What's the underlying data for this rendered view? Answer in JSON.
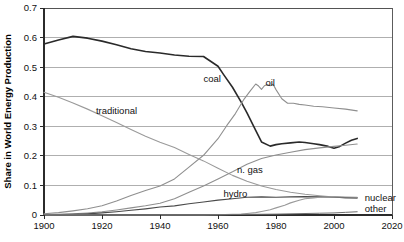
{
  "chart_data": {
    "type": "line",
    "title": "",
    "xlabel": "",
    "ylabel": "Share in World Energy Production",
    "xlim": [
      1900,
      2020
    ],
    "ylim": [
      0,
      0.7
    ],
    "grid": true,
    "legend": "inline-labels",
    "x_ticks": [
      "1900",
      "1920",
      "1940",
      "1960",
      "1980",
      "2000",
      "2020"
    ],
    "x_tick_values": [
      1900,
      1920,
      1940,
      1960,
      1980,
      2000,
      2020
    ],
    "y_ticks": [
      "0",
      "0.1",
      "0.2",
      "0.3",
      "0.4",
      "0.5",
      "0.6",
      "0.7"
    ],
    "y_tick_values": [
      0,
      0.1,
      0.2,
      0.3,
      0.4,
      0.5,
      0.6,
      0.7
    ],
    "series": [
      {
        "name": "coal",
        "label": "coal",
        "color": "#2a2a2a",
        "width": 1.6,
        "label_x": 1958,
        "label_y": 0.462,
        "x": [
          1900,
          1905,
          1910,
          1915,
          1920,
          1925,
          1930,
          1935,
          1940,
          1945,
          1950,
          1955,
          1960,
          1962,
          1965,
          1968,
          1970,
          1973,
          1975,
          1978,
          1980,
          1982,
          1985,
          1988,
          1990,
          1993,
          1995,
          1998,
          2000,
          2002,
          2004,
          2006,
          2008
        ],
        "y": [
          0.578,
          0.592,
          0.604,
          0.598,
          0.588,
          0.576,
          0.562,
          0.553,
          0.548,
          0.541,
          0.537,
          0.536,
          0.503,
          0.474,
          0.432,
          0.382,
          0.345,
          0.286,
          0.247,
          0.233,
          0.238,
          0.241,
          0.244,
          0.247,
          0.245,
          0.241,
          0.238,
          0.232,
          0.226,
          0.232,
          0.243,
          0.253,
          0.259
        ]
      },
      {
        "name": "oil",
        "label": "oil",
        "color": "#8f8f8f",
        "width": 1.1,
        "label_x": 1978,
        "label_y": 0.448,
        "x": [
          1900,
          1905,
          1910,
          1915,
          1920,
          1925,
          1930,
          1935,
          1940,
          1945,
          1950,
          1955,
          1960,
          1963,
          1966,
          1969,
          1971,
          1973,
          1974,
          1975,
          1976,
          1977,
          1978,
          1979,
          1980,
          1982,
          1984,
          1986,
          1988,
          1990,
          1993,
          1996,
          2000,
          2004,
          2008
        ],
        "y": [
          0.004,
          0.008,
          0.014,
          0.021,
          0.031,
          0.047,
          0.066,
          0.083,
          0.098,
          0.122,
          0.162,
          0.202,
          0.258,
          0.302,
          0.343,
          0.392,
          0.418,
          0.443,
          0.436,
          0.425,
          0.437,
          0.441,
          0.437,
          0.442,
          0.424,
          0.393,
          0.378,
          0.378,
          0.374,
          0.372,
          0.368,
          0.366,
          0.362,
          0.358,
          0.352
        ]
      },
      {
        "name": "traditional",
        "label": "traditional",
        "color": "#9a9a9a",
        "width": 1.1,
        "label_x": 1925,
        "label_y": 0.352,
        "x": [
          1900,
          1905,
          1910,
          1915,
          1920,
          1925,
          1930,
          1935,
          1940,
          1945,
          1950,
          1955,
          1960,
          1965,
          1970,
          1975,
          1980,
          1985,
          1990,
          1995,
          2000,
          2004,
          2008
        ],
        "y": [
          0.415,
          0.398,
          0.379,
          0.358,
          0.336,
          0.313,
          0.289,
          0.266,
          0.246,
          0.228,
          0.205,
          0.183,
          0.158,
          0.134,
          0.114,
          0.098,
          0.086,
          0.077,
          0.07,
          0.065,
          0.061,
          0.058,
          0.056
        ]
      },
      {
        "name": "n. gas",
        "label": "n. gas",
        "color": "#8f8f8f",
        "width": 1.1,
        "label_x": 1971,
        "label_y": 0.152,
        "x": [
          1900,
          1905,
          1910,
          1915,
          1920,
          1925,
          1930,
          1935,
          1940,
          1945,
          1950,
          1955,
          1960,
          1965,
          1970,
          1975,
          1980,
          1985,
          1990,
          1995,
          2000,
          2004,
          2008
        ],
        "y": [
          0.001,
          0.002,
          0.004,
          0.007,
          0.011,
          0.017,
          0.024,
          0.031,
          0.04,
          0.055,
          0.077,
          0.098,
          0.122,
          0.146,
          0.172,
          0.191,
          0.203,
          0.212,
          0.221,
          0.227,
          0.232,
          0.236,
          0.24
        ]
      },
      {
        "name": "hydro",
        "label": "hydro",
        "color": "#4a4a4a",
        "width": 1.2,
        "label_x": 1966,
        "label_y": 0.073,
        "x": [
          1900,
          1905,
          1910,
          1915,
          1920,
          1925,
          1930,
          1935,
          1940,
          1945,
          1950,
          1955,
          1960,
          1965,
          1970,
          1975,
          1980,
          1985,
          1990,
          1995,
          2000,
          2004,
          2008
        ],
        "y": [
          0.0,
          0.001,
          0.002,
          0.004,
          0.007,
          0.011,
          0.016,
          0.021,
          0.027,
          0.031,
          0.038,
          0.044,
          0.05,
          0.055,
          0.06,
          0.061,
          0.06,
          0.061,
          0.062,
          0.061,
          0.06,
          0.059,
          0.059
        ]
      },
      {
        "name": "nuclear",
        "label": "nuclear",
        "color": "#9a9a9a",
        "width": 1.1,
        "label_x": 2012,
        "label_y": 0.058,
        "x": [
          1900,
          1950,
          1955,
          1960,
          1965,
          1968,
          1970,
          1973,
          1975,
          1978,
          1980,
          1983,
          1985,
          1988,
          1990,
          1993,
          1995,
          2000,
          2004,
          2008
        ],
        "y": [
          0.0,
          0.0,
          0.0,
          0.001,
          0.002,
          0.003,
          0.005,
          0.008,
          0.012,
          0.018,
          0.024,
          0.033,
          0.041,
          0.05,
          0.055,
          0.058,
          0.06,
          0.062,
          0.061,
          0.06
        ]
      },
      {
        "name": "other",
        "label": "other",
        "color": "#6e6e6e",
        "width": 1.0,
        "label_x": 2012,
        "label_y": 0.02,
        "x": [
          1900,
          1930,
          1950,
          1960,
          1970,
          1980,
          1990,
          1995,
          2000,
          2004,
          2008
        ],
        "y": [
          0.0,
          0.0,
          0.001,
          0.001,
          0.002,
          0.003,
          0.005,
          0.006,
          0.007,
          0.009,
          0.011
        ]
      }
    ]
  }
}
